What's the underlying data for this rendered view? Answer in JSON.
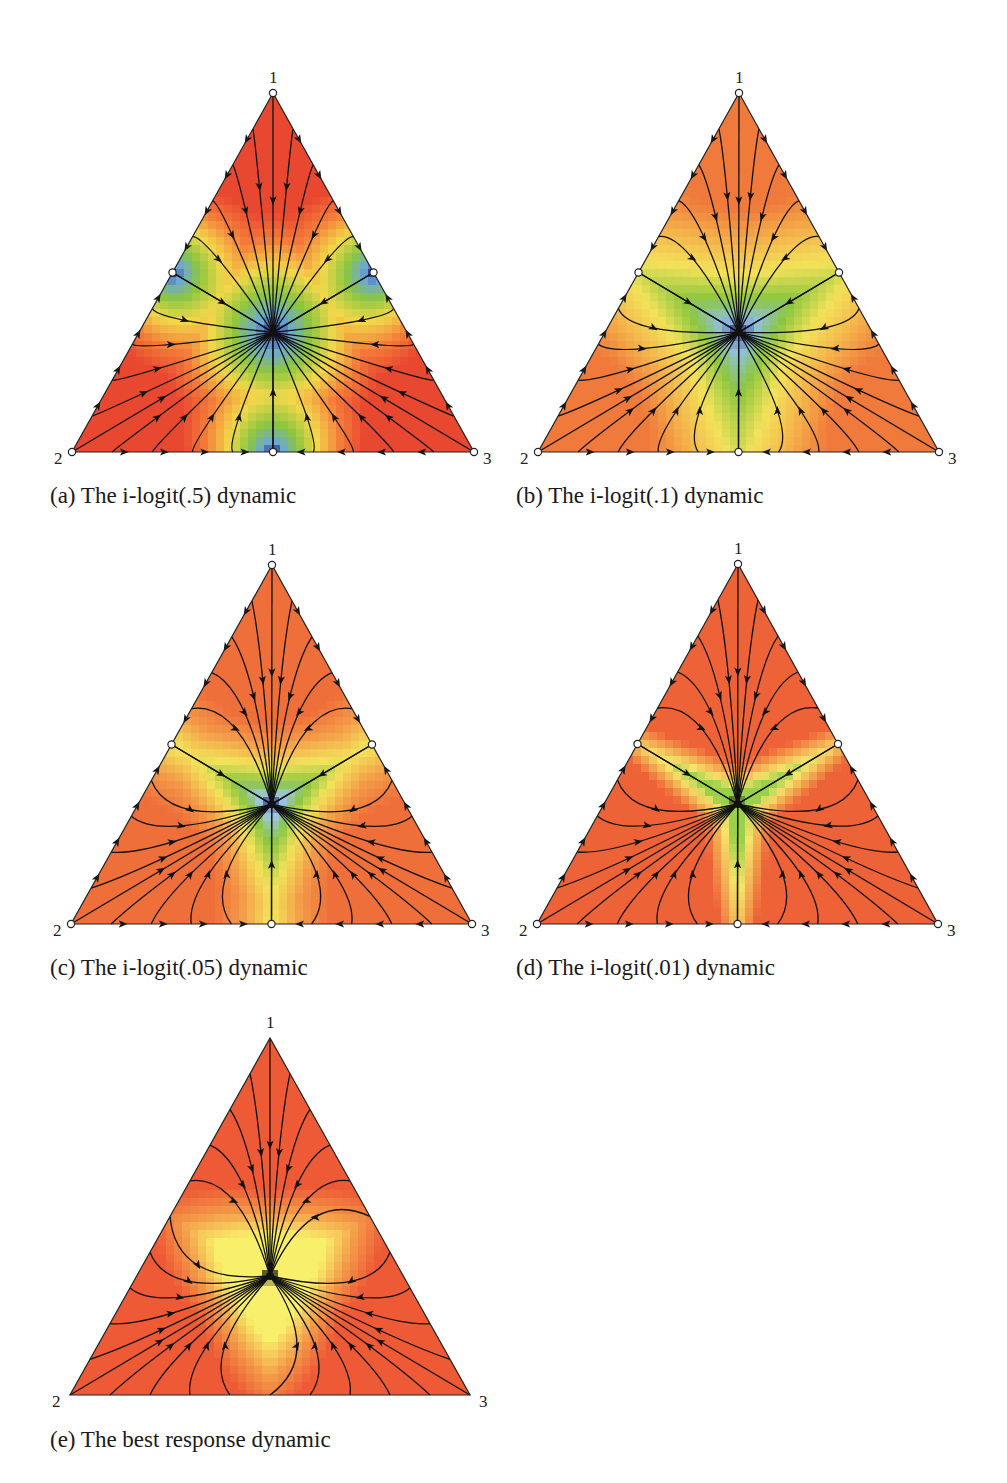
{
  "figure": {
    "panels": [
      {
        "id": "a",
        "caption": "(a) The i-logit(.5) dynamic",
        "vertex_labels": {
          "top": "1",
          "left": "2",
          "right": "3"
        },
        "top": [
          273,
          93
        ],
        "left": [
          72,
          452
        ],
        "right": [
          474,
          452
        ],
        "caption_pos": [
          50,
          484
        ],
        "noise": 0.5,
        "rest_points": {
          "vertices_open": true,
          "midpoints_open": true,
          "center": "closed"
        },
        "colors": [
          "#e8482f",
          "#f47c3a",
          "#f2d84a",
          "#8cc63f",
          "#6aa8d9",
          "#2b2f7a"
        ],
        "color_stops_desc": "red at vertices, yellow/green bands, blue near midpoints and center"
      },
      {
        "id": "b",
        "caption": "(b) The i-logit(.1) dynamic",
        "vertex_labels": {
          "top": "1",
          "left": "2",
          "right": "3"
        },
        "top": [
          739,
          93
        ],
        "left": [
          538,
          452
        ],
        "right": [
          939,
          452
        ],
        "caption_pos": [
          516,
          484
        ],
        "noise": 0.1,
        "rest_points": {
          "vertices_open": true,
          "midpoints_open": true,
          "center": "closed"
        },
        "colors": [
          "#ef7a3c",
          "#f4b04a",
          "#f3e25a",
          "#8cc63f",
          "#8fc0e3",
          "#2b2f7a"
        ]
      },
      {
        "id": "c",
        "caption": "(c) The i-logit(.05) dynamic",
        "vertex_labels": {
          "top": "1",
          "left": "2",
          "right": "3"
        },
        "top": [
          272,
          565
        ],
        "left": [
          71,
          924
        ],
        "right": [
          472,
          924
        ],
        "caption_pos": [
          50,
          956
        ],
        "noise": 0.05,
        "rest_points": {
          "vertices_open": true,
          "midpoints_open": true,
          "center": "closed"
        },
        "colors": [
          "#ef6f3a",
          "#f39a48",
          "#f3e25a",
          "#8cc63f",
          "#9cc7e6",
          "#2b2f7a"
        ]
      },
      {
        "id": "d",
        "caption": "(d) The i-logit(.01) dynamic",
        "vertex_labels": {
          "top": "1",
          "left": "2",
          "right": "3"
        },
        "top": [
          738,
          564
        ],
        "left": [
          537,
          924
        ],
        "right": [
          938,
          924
        ],
        "caption_pos": [
          516,
          956
        ],
        "noise": 0.01,
        "rest_points": {
          "vertices_open": true,
          "midpoints_open": true,
          "center": "closed"
        },
        "colors": [
          "#ee6238",
          "#f3a24c",
          "#f6e36a",
          "#9bd04a",
          "#9bd04a",
          "#111111"
        ]
      },
      {
        "id": "e",
        "caption": "(e) The best response dynamic",
        "vertex_labels": {
          "top": "1",
          "left": "2",
          "right": "3"
        },
        "top": [
          270,
          1038
        ],
        "left": [
          70,
          1395
        ],
        "right": [
          470,
          1395
        ],
        "caption_pos": [
          50,
          1428
        ],
        "noise": 0,
        "rest_points": {
          "vertices_open": false,
          "midpoints_open": false,
          "center": "closed"
        },
        "colors": [
          "#ee5a36",
          "#f39a48",
          "#f8ef6a",
          "#f8ef6a",
          "#f8ef6a",
          "#111111"
        ]
      }
    ],
    "chart_data": [
      {
        "type": "diagram",
        "title": "(a) The i-logit(.5) dynamic",
        "kind": "simplex phase portrait",
        "strategies": [
          "1",
          "2",
          "3"
        ],
        "rest_point": "barycenter (1/3,1/3,1/3)",
        "eta": 0.5
      },
      {
        "type": "diagram",
        "title": "(b) The i-logit(.1) dynamic",
        "kind": "simplex phase portrait",
        "strategies": [
          "1",
          "2",
          "3"
        ],
        "rest_point": "barycenter (1/3,1/3,1/3)",
        "eta": 0.1
      },
      {
        "type": "diagram",
        "title": "(c) The i-logit(.05) dynamic",
        "kind": "simplex phase portrait",
        "strategies": [
          "1",
          "2",
          "3"
        ],
        "rest_point": "barycenter (1/3,1/3,1/3)",
        "eta": 0.05
      },
      {
        "type": "diagram",
        "title": "(d) The i-logit(.01) dynamic",
        "kind": "simplex phase portrait",
        "strategies": [
          "1",
          "2",
          "3"
        ],
        "rest_point": "barycenter (1/3,1/3,1/3)",
        "eta": 0.01
      },
      {
        "type": "diagram",
        "title": "(e) The best response dynamic",
        "kind": "simplex phase portrait",
        "strategies": [
          "1",
          "2",
          "3"
        ],
        "rest_point": "barycenter (1/3,1/3,1/3)",
        "eta": 0
      }
    ]
  }
}
